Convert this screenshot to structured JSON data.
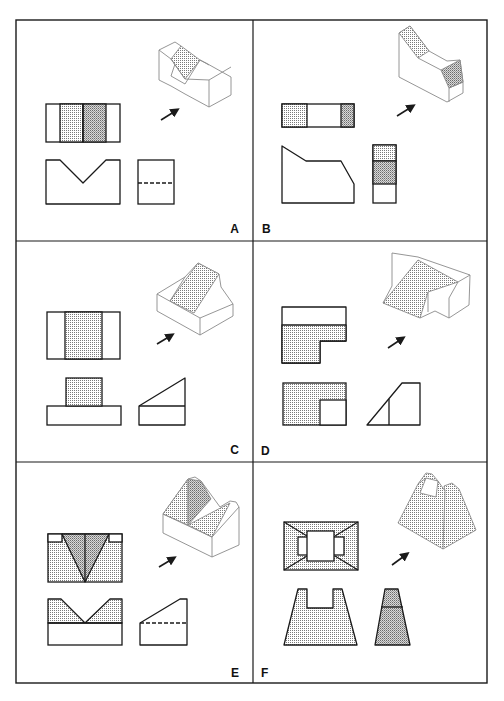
{
  "figure": {
    "frame": {
      "x": 16,
      "y": 20,
      "w": 471,
      "h": 663
    },
    "dividers": {
      "vertical_x": 253,
      "horizontal_y": [
        241,
        462
      ]
    },
    "colors": {
      "ink": "#1a1a1a",
      "iso_ink": "#8a8a8a",
      "dot": "#7a7a7a",
      "paper": "#ffffff"
    }
  },
  "panels": [
    {
      "id": "A",
      "label": "A",
      "label_pos": [
        239,
        233
      ],
      "label_anchor": "end",
      "views": [
        {
          "name": "top-view",
          "shapes": [
            {
              "t": "rect",
              "x": 46,
              "y": 104,
              "w": 74,
              "h": 38
            },
            {
              "t": "rect",
              "x": 60,
              "y": 104,
              "w": 23,
              "h": 38,
              "fill": "dots"
            },
            {
              "t": "rect",
              "x": 83,
              "y": 104,
              "w": 23,
              "h": 38,
              "fill": "dots2"
            },
            {
              "t": "line",
              "x1": 83,
              "y1": 104,
              "x2": 83,
              "y2": 142
            }
          ]
        },
        {
          "name": "front-view",
          "shapes": [
            {
              "t": "poly",
              "pts": "46,160 60,160 83,183 106,160 120,160 120,204 46,204"
            }
          ]
        },
        {
          "name": "side-view",
          "shapes": [
            {
              "t": "rect",
              "x": 138,
              "y": 160,
              "w": 36,
              "h": 44
            },
            {
              "t": "dash",
              "x1": 138,
              "y1": 183,
              "x2": 174,
              "y2": 183
            }
          ]
        },
        {
          "name": "isometric-view",
          "iso": true,
          "shapes": [
            {
              "t": "poly",
              "pts": "159,50 175,42 181,46 171,76 185,84 200,60 206,63 231,77 231,95 209,107 185,94 171,86 159,80"
            },
            {
              "t": "poly",
              "pts": "171,59 181,46 200,60 185,79",
              "fill": "dots"
            },
            {
              "t": "line",
              "x1": 159,
              "y1": 50,
              "x2": 171,
              "y2": 59
            },
            {
              "t": "line",
              "x1": 171,
              "y1": 59,
              "x2": 185,
              "y2": 79
            },
            {
              "t": "line",
              "x1": 185,
              "y1": 79,
              "x2": 209,
              "y2": 80
            },
            {
              "t": "line",
              "x1": 209,
              "y1": 80,
              "x2": 209,
              "y2": 107
            },
            {
              "t": "line",
              "x1": 209,
              "y1": 80,
              "x2": 231,
              "y2": 67
            },
            {
              "t": "line",
              "x1": 200,
              "y1": 60,
              "x2": 209,
              "y2": 65
            }
          ]
        },
        {
          "name": "arrow",
          "arrow": [
            161,
            120,
            177,
            110
          ]
        }
      ]
    },
    {
      "id": "B",
      "label": "B",
      "label_pos": [
        262,
        233
      ],
      "label_anchor": "start",
      "views": [
        {
          "name": "top-view",
          "shapes": [
            {
              "t": "rect",
              "x": 282,
              "y": 104,
              "w": 72,
              "h": 23
            },
            {
              "t": "rect",
              "x": 282,
              "y": 104,
              "w": 25,
              "h": 23,
              "fill": "dots"
            },
            {
              "t": "rect",
              "x": 341,
              "y": 104,
              "w": 13,
              "h": 23,
              "fill": "dots2"
            }
          ]
        },
        {
          "name": "front-view",
          "shapes": [
            {
              "t": "poly",
              "pts": "282,146 306,161 341,161 354,184 354,203 282,203"
            }
          ]
        },
        {
          "name": "side-view",
          "shapes": [
            {
              "t": "rect",
              "x": 373,
              "y": 145,
              "w": 23,
              "h": 58
            },
            {
              "t": "rect",
              "x": 373,
              "y": 145,
              "w": 23,
              "h": 16,
              "fill": "dots"
            },
            {
              "t": "rect",
              "x": 373,
              "y": 161,
              "w": 23,
              "h": 23,
              "fill": "dots2"
            }
          ]
        },
        {
          "name": "isometric-view",
          "iso": true,
          "shapes": [
            {
              "t": "poly",
              "pts": "399,33 410,26 429,51 447,61 460,60 463,82 463,93 447,102 399,77"
            },
            {
              "t": "poly",
              "pts": "399,33 410,26 429,51 418,58",
              "fill": "dots"
            },
            {
              "t": "poly",
              "pts": "441,70 460,60 463,82 449,88",
              "fill": "dots2"
            },
            {
              "t": "line",
              "x1": 418,
              "y1": 58,
              "x2": 441,
              "y2": 70
            },
            {
              "t": "line",
              "x1": 449,
              "y1": 88,
              "x2": 449,
              "y2": 102
            },
            {
              "t": "line",
              "x1": 449,
              "y1": 88,
              "x2": 463,
              "y2": 82
            }
          ]
        },
        {
          "name": "arrow",
          "arrow": [
            397,
            116,
            413,
            106
          ]
        }
      ]
    },
    {
      "id": "C",
      "label": "C",
      "label_pos": [
        239,
        454
      ],
      "label_anchor": "end",
      "views": [
        {
          "name": "top-view",
          "shapes": [
            {
              "t": "rect",
              "x": 47,
              "y": 312,
              "w": 73,
              "h": 47
            },
            {
              "t": "rect",
              "x": 65,
              "y": 312,
              "w": 37,
              "h": 47,
              "fill": "dots"
            }
          ]
        },
        {
          "name": "front-view",
          "shapes": [
            {
              "t": "rect",
              "x": 47,
              "y": 406,
              "w": 74,
              "h": 19
            },
            {
              "t": "rect",
              "x": 66,
              "y": 378,
              "w": 36,
              "h": 28,
              "fill": "dots"
            }
          ]
        },
        {
          "name": "side-view",
          "shapes": [
            {
              "t": "poly",
              "pts": "139,406 185,378 185,425 139,425"
            },
            {
              "t": "line",
              "x1": 139,
              "y1": 406,
              "x2": 185,
              "y2": 406
            }
          ]
        },
        {
          "name": "isometric-view",
          "iso": true,
          "shapes": [
            {
              "t": "poly",
              "pts": "157,294 185,277 198,263 219,274 221,287 233,304 233,316 200,335 157,311"
            },
            {
              "t": "poly",
              "pts": "170,301 198,263 219,274 194,313",
              "fill": "dots"
            },
            {
              "t": "line",
              "x1": 157,
              "y1": 294,
              "x2": 200,
              "y2": 318
            },
            {
              "t": "line",
              "x1": 200,
              "y1": 318,
              "x2": 233,
              "y2": 304
            },
            {
              "t": "line",
              "x1": 200,
              "y1": 318,
              "x2": 200,
              "y2": 335
            },
            {
              "t": "line",
              "x1": 185,
              "y1": 277,
              "x2": 170,
              "y2": 301
            }
          ]
        },
        {
          "name": "arrow",
          "arrow": [
            157,
            344,
            172,
            335
          ]
        }
      ]
    },
    {
      "id": "D",
      "label": "D",
      "label_pos": [
        261,
        455
      ],
      "label_anchor": "start",
      "views": [
        {
          "name": "top-view",
          "shapes": [
            {
              "t": "poly",
              "pts": "282,307 346,307 346,341 320,341 320,363 282,363"
            },
            {
              "t": "poly",
              "pts": "282,325 346,325 346,341 320,341 320,363 282,363",
              "fill": "dots"
            }
          ]
        },
        {
          "name": "front-view",
          "shapes": [
            {
              "t": "rect",
              "x": 283,
              "y": 383,
              "w": 63,
              "h": 42,
              "fill": "dots"
            },
            {
              "t": "rect",
              "x": 320,
              "y": 400,
              "w": 26,
              "h": 25,
              "fill": "white"
            }
          ]
        },
        {
          "name": "side-view",
          "shapes": [
            {
              "t": "poly",
              "pts": "367,425 402,383 420,383 420,425"
            },
            {
              "t": "line",
              "x1": 389,
              "y1": 399,
              "x2": 389,
              "y2": 425
            }
          ]
        },
        {
          "name": "isometric-view",
          "iso": true,
          "shapes": [
            {
              "t": "poly",
              "pts": "392,253 418,257 470,275 469,305 449,318 435,311 420,318 418,304 392,305 383,303 392,286 392,261"
            },
            {
              "t": "poly",
              "pts": "383,303 418,260 458,282 428,292 420,318",
              "fill": "dots"
            },
            {
              "t": "line",
              "x1": 458,
              "y1": 282,
              "x2": 470,
              "y2": 275
            },
            {
              "t": "line",
              "x1": 458,
              "y1": 282,
              "x2": 449,
              "y2": 298
            },
            {
              "t": "line",
              "x1": 449,
              "y1": 298,
              "x2": 449,
              "y2": 318
            },
            {
              "t": "line",
              "x1": 428,
              "y1": 292,
              "x2": 428,
              "y2": 312
            }
          ]
        },
        {
          "name": "arrow",
          "arrow": [
            388,
            348,
            403,
            338
          ]
        }
      ]
    },
    {
      "id": "E",
      "label": "E",
      "label_pos": [
        239,
        677
      ],
      "label_anchor": "end",
      "views": [
        {
          "name": "top-view",
          "shapes": [
            {
              "t": "rect",
              "x": 48,
              "y": 534,
              "w": 74,
              "h": 48,
              "fill": "dots"
            },
            {
              "t": "rect",
              "x": 48,
              "y": 534,
              "w": 14,
              "h": 8,
              "fill": "white"
            },
            {
              "t": "rect",
              "x": 109,
              "y": 534,
              "w": 13,
              "h": 8,
              "fill": "white"
            },
            {
              "t": "poly",
              "pts": "62,534 109,534 85,582",
              "fill": "dots2"
            },
            {
              "t": "line",
              "x1": 85,
              "y1": 534,
              "x2": 85,
              "y2": 582
            }
          ]
        },
        {
          "name": "front-view",
          "shapes": [
            {
              "t": "poly",
              "pts": "48,599 61,599 85,623 110,599 122,599 122,623 48,623",
              "fill": "dots"
            },
            {
              "t": "rect",
              "x": 48,
              "y": 623,
              "w": 74,
              "h": 22
            }
          ]
        },
        {
          "name": "side-view",
          "shapes": [
            {
              "t": "poly",
              "pts": "140,623 180,599 187,599 187,645 140,645"
            },
            {
              "t": "dash",
              "x1": 140,
              "y1": 623,
              "x2": 187,
              "y2": 623
            }
          ]
        },
        {
          "name": "isometric-view",
          "iso": true,
          "shapes": [
            {
              "t": "poly",
              "pts": "163,514 188,479 195,477 201,481 220,507 230,501 236,502 239,507 239,545 212,557 163,533"
            },
            {
              "t": "poly",
              "pts": "163,514 188,479 188,525",
              "fill": "dots"
            },
            {
              "t": "poly",
              "pts": "188,479 201,481 211,499 188,525",
              "fill": "dots2"
            },
            {
              "t": "poly",
              "pts": "188,525 230,503 212,537",
              "fill": "dots"
            },
            {
              "t": "line",
              "x1": 163,
              "y1": 514,
              "x2": 212,
              "y2": 537
            },
            {
              "t": "line",
              "x1": 212,
              "y1": 537,
              "x2": 212,
              "y2": 557
            },
            {
              "t": "line",
              "x1": 212,
              "y1": 537,
              "x2": 239,
              "y2": 507
            }
          ]
        },
        {
          "name": "arrow",
          "arrow": [
            159,
            567,
            174,
            558
          ]
        }
      ]
    },
    {
      "id": "F",
      "label": "F",
      "label_pos": [
        261,
        677
      ],
      "label_anchor": "start",
      "views": [
        {
          "name": "top-view",
          "shapes": [
            {
              "t": "rect",
              "x": 284,
              "y": 522,
              "w": 74,
              "h": 48,
              "fill": "dots"
            },
            {
              "t": "line",
              "x1": 284,
              "y1": 522,
              "x2": 307,
              "y2": 536
            },
            {
              "t": "line",
              "x1": 358,
              "y1": 522,
              "x2": 335,
              "y2": 536
            },
            {
              "t": "line",
              "x1": 284,
              "y1": 570,
              "x2": 307,
              "y2": 556
            },
            {
              "t": "line",
              "x1": 358,
              "y1": 570,
              "x2": 335,
              "y2": 556
            },
            {
              "t": "rect",
              "x": 298,
              "y": 537,
              "w": 46,
              "h": 18,
              "fill": "white"
            },
            {
              "t": "rect",
              "x": 307,
              "y": 531,
              "w": 27,
              "h": 30,
              "fill": "white"
            }
          ]
        },
        {
          "name": "front-view",
          "shapes": [
            {
              "t": "poly",
              "pts": "298,589 307,589 307,608 333,608 333,589 342,589 357,645 284,645",
              "fill": "dots"
            }
          ]
        },
        {
          "name": "side-view",
          "shapes": [
            {
              "t": "poly",
              "pts": "385,589 398,589 410,645 375,645",
              "fill": "dots2"
            },
            {
              "t": "line",
              "x1": 381,
              "y1": 607,
              "x2": 403,
              "y2": 607
            }
          ]
        },
        {
          "name": "isometric-view",
          "iso": true,
          "shapes": [
            {
              "t": "poly",
              "pts": "418,484 426,473 432,474 438,481 445,491 444,486 452,483 459,489 476,530 443,549 398,523",
              "fill": "dots"
            },
            {
              "t": "poly",
              "pts": "426,478 438,481 436,497 420,493",
              "fill": "white"
            },
            {
              "t": "line",
              "x1": 445,
              "y1": 491,
              "x2": 443,
              "y2": 549
            },
            {
              "t": "line",
              "x1": 418,
              "y1": 484,
              "x2": 426,
              "y2": 478
            }
          ]
        },
        {
          "name": "arrow",
          "arrow": [
            392,
            565,
            407,
            554
          ]
        }
      ]
    }
  ]
}
